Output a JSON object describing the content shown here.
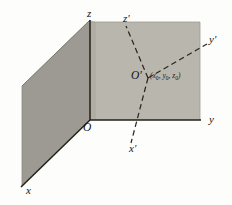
{
  "figure": {
    "background_color": "#fdfdfc",
    "planes": {
      "xz_plane_color": "#9d9a93",
      "yz_plane_color": "#b8b5ad",
      "edge_color": "#3a3730"
    },
    "axes": {
      "solid_color": "#232019",
      "dashed_color": "#2a2722"
    }
  },
  "labels": {
    "z_axis": "z",
    "y_axis": "y",
    "x_axis": "x",
    "z_prime_axis": "z'",
    "y_prime_axis": "y'",
    "x_prime_axis": "x'",
    "origin": "O",
    "translated_origin": "O'",
    "translated_origin_coordinates_open": "(",
    "coord_x": "x",
    "coord_x_sub": "0",
    "coord_sep_1": ", ",
    "coord_y": "y",
    "coord_y_sub": "0",
    "coord_sep_2": ", ",
    "coord_z": "z",
    "coord_z_sub": "0",
    "translated_origin_coordinates_close": ")"
  },
  "geometry": {
    "origin_point": "90,120",
    "translated_origin_point": "148,78",
    "z_axis_top": "90,20",
    "y_axis_end": "200,120",
    "x_axis_end": "22,186",
    "z_prime_end": "126,26",
    "y_prime_end": "206,45",
    "x_prime_end": "131,142"
  }
}
